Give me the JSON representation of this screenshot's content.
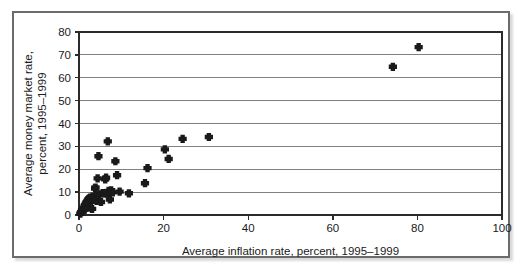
{
  "chart_data": {
    "type": "scatter",
    "title": "",
    "xlabel": "Average inflation rate, percent, 1995–1999",
    "ylabel_line1": "Average money market rate,",
    "ylabel_line2": "percent, 1995–1999",
    "ylabel": "Average money market rate, percent, 1995–1999",
    "xlim": [
      0,
      100
    ],
    "ylim": [
      0,
      80
    ],
    "xticks": [
      0,
      20,
      40,
      60,
      80,
      100
    ],
    "yticks": [
      0,
      10,
      20,
      30,
      40,
      50,
      60,
      70,
      80
    ],
    "xticklabels": [
      "0",
      "20",
      "40",
      "60",
      "80",
      "100"
    ],
    "yticklabels": [
      "0",
      "10",
      "20",
      "30",
      "40",
      "50",
      "60",
      "70",
      "80"
    ],
    "grid": {
      "horizontal": true,
      "vertical": false,
      "color": "#808080"
    },
    "legend": null,
    "marker": {
      "shape": "plus-diamond",
      "color": "#1a1a1a",
      "size": 4.2
    },
    "series": [
      {
        "name": "Countries",
        "points": [
          [
            0.3,
            0.6
          ],
          [
            0.5,
            1.2
          ],
          [
            0.7,
            2.0
          ],
          [
            0.9,
            1.5
          ],
          [
            1.0,
            3.0
          ],
          [
            1.1,
            2.4
          ],
          [
            1.3,
            3.6
          ],
          [
            1.4,
            4.3
          ],
          [
            1.5,
            3.1
          ],
          [
            1.6,
            5.0
          ],
          [
            1.7,
            4.6
          ],
          [
            1.8,
            5.6
          ],
          [
            1.9,
            4.0
          ],
          [
            2.0,
            6.1
          ],
          [
            2.1,
            5.2
          ],
          [
            2.2,
            6.8
          ],
          [
            2.3,
            3.2
          ],
          [
            2.4,
            7.2
          ],
          [
            2.5,
            6.4
          ],
          [
            2.6,
            7.6
          ],
          [
            2.8,
            5.9
          ],
          [
            3.0,
            7.4
          ],
          [
            3.1,
            2.7
          ],
          [
            3.2,
            8.0
          ],
          [
            3.4,
            6.6
          ],
          [
            3.6,
            7.0
          ],
          [
            3.8,
            11.6
          ],
          [
            3.9,
            12.0
          ],
          [
            4.0,
            8.3
          ],
          [
            4.2,
            6.2
          ],
          [
            4.4,
            16.0
          ],
          [
            4.6,
            25.7
          ],
          [
            4.8,
            9.0
          ],
          [
            5.2,
            5.7
          ],
          [
            5.6,
            9.6
          ],
          [
            6.0,
            9.5
          ],
          [
            6.2,
            15.6
          ],
          [
            6.4,
            16.3
          ],
          [
            6.6,
            9.3
          ],
          [
            6.8,
            32.2
          ],
          [
            7.0,
            10.5
          ],
          [
            7.3,
            6.8
          ],
          [
            7.6,
            10.8
          ],
          [
            8.0,
            9.9
          ],
          [
            8.6,
            23.5
          ],
          [
            9.0,
            17.4
          ],
          [
            9.6,
            10.2
          ],
          [
            11.8,
            9.5
          ],
          [
            15.6,
            13.9
          ],
          [
            16.2,
            20.5
          ],
          [
            20.3,
            28.7
          ],
          [
            21.2,
            24.5
          ],
          [
            24.5,
            33.3
          ],
          [
            30.7,
            34.1
          ],
          [
            74.2,
            64.8
          ],
          [
            80.3,
            73.4
          ]
        ]
      }
    ]
  }
}
